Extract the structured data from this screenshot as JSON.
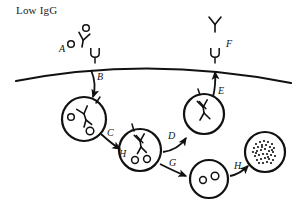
{
  "figure": {
    "title": "Low IgG",
    "line_color": "#111111",
    "background": "#ffffff"
  },
  "labels": {
    "a": "A",
    "b": "B",
    "c": "C",
    "d": "D",
    "e": "E",
    "f": "F",
    "g": "G",
    "h_arrow": "H",
    "h_vesicle": "H"
  },
  "membrane": {
    "name": "cell-membrane-curve"
  },
  "structures": {
    "extracellular_complex": "antibody-antigen-complex",
    "surface_receptor_left": "fcrn-receptor",
    "surface_receptor_right": "fcrn-receptor",
    "released_antibody": "free-antibody",
    "vesicle_1": "endosome-with-antibody-and-antigen",
    "vesicle_2": "endosome-with-antibody-and-antigen",
    "vesicle_3": "recycling-endosome-with-antibody",
    "vesicle_4": "endosome-with-antigen",
    "vesicle_5": "lysosome-degraded-contents"
  }
}
